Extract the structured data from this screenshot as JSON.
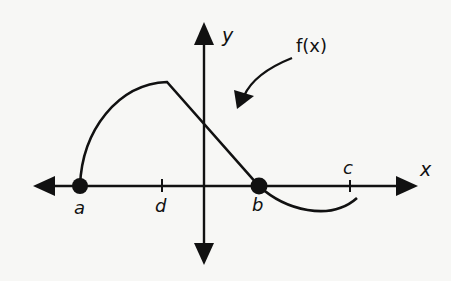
{
  "diagram": {
    "type": "function-graph",
    "axes": {
      "x_label": "x",
      "y_label": "y"
    },
    "function_label": "f(x)",
    "points": [
      {
        "name": "a",
        "label": "a",
        "marker": "filled-dot",
        "on_axis": "x"
      },
      {
        "name": "d",
        "label": "d",
        "marker": "tick",
        "on_axis": "x"
      },
      {
        "name": "b",
        "label": "b",
        "marker": "filled-dot",
        "on_axis": "x"
      },
      {
        "name": "c",
        "label": "c",
        "marker": "tick",
        "on_axis": "x"
      }
    ],
    "curve_description": "Starts at a on x-axis, concave-down arc rising to a peak above d, then straight line descending through the y-axis to b on the x-axis, then concave-up arc dipping below x-axis ending just past c.",
    "colors": {
      "ink": "#111111",
      "background": "#f7f7f5"
    }
  }
}
